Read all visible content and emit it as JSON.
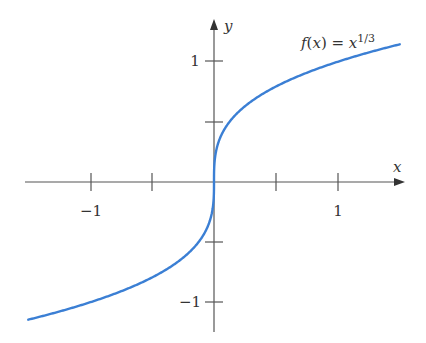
{
  "chart_data": {
    "type": "line",
    "title": "",
    "function_label": {
      "f": "f",
      "paren_x": "(x) = x",
      "exponent": "1/3"
    },
    "xlabel": "x",
    "ylabel": "y",
    "xlim": [
      -1.54,
      1.54
    ],
    "ylim": [
      -1.24,
      1.35
    ],
    "x_ticks": [
      -1,
      -0.5,
      0,
      0.5,
      1
    ],
    "x_tick_labels": [
      {
        "value": -1,
        "label": "−1"
      },
      {
        "value": 1,
        "label": "1"
      }
    ],
    "y_ticks": [
      -1,
      -0.5,
      0.5,
      1
    ],
    "y_tick_labels": [
      {
        "value": 1,
        "label": "1"
      },
      {
        "value": -1,
        "label": "−1"
      }
    ],
    "grid": false,
    "legend": null,
    "series": [
      {
        "name": "f(x) = x^(1/3)",
        "color": "#3b7fd4",
        "x": [
          -1.51,
          -1.25,
          -1.0,
          -0.75,
          -0.5,
          -0.25,
          -0.1,
          -0.02,
          0,
          0.02,
          0.1,
          0.25,
          0.5,
          0.75,
          1.0,
          1.25,
          1.51
        ],
        "values": [
          -1.147,
          -1.077,
          -1.0,
          -0.909,
          -0.794,
          -0.63,
          -0.464,
          -0.271,
          0,
          0.271,
          0.464,
          0.63,
          0.794,
          0.909,
          1.0,
          1.077,
          1.147
        ]
      }
    ]
  },
  "labels": {
    "x_axis": "x",
    "y_axis": "y",
    "tick_x_neg1": "−1",
    "tick_x_pos1": "1",
    "tick_y_pos1": "1",
    "tick_y_neg1": "−1",
    "func_f": "f",
    "func_open": "(",
    "func_x": "x",
    "func_close_eq": ") = ",
    "func_base": "x",
    "func_exp": "1/3"
  },
  "colors": {
    "axis": "#555555",
    "curve": "#3b7fd4"
  }
}
